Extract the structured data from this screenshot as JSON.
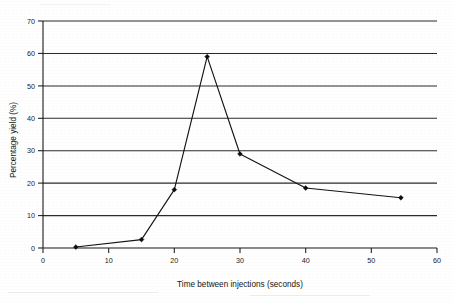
{
  "chart_data": {
    "type": "line",
    "title": "",
    "subtitle": "",
    "xlabel": "Time between injections (seconds)",
    "ylabel": "Percentage yield (%)",
    "xlim": [
      0,
      60
    ],
    "ylim": [
      0,
      70
    ],
    "xticks": [
      0,
      10,
      20,
      30,
      40,
      50,
      60
    ],
    "yticks": [
      0,
      10,
      20,
      30,
      40,
      50,
      60,
      70
    ],
    "xtick_labels": [
      "0",
      "10",
      "20",
      "30",
      "40",
      "50",
      "60"
    ],
    "ytick_labels": [
      "0",
      "10",
      "20",
      "30",
      "40",
      "50",
      "60",
      "70"
    ],
    "grid": "horizontal",
    "legend": "none",
    "marker": "filled-diamond",
    "line_color": "#151515",
    "marker_color": "#0d0d0d",
    "grid_color": "#2b2b2b",
    "background_color": "#ffffff",
    "x": [
      5,
      15,
      20,
      25,
      30,
      40,
      54.5
    ],
    "y": [
      0.3,
      2.6,
      18.0,
      59.0,
      29.0,
      18.5,
      15.5
    ],
    "series": [
      {
        "name": "Percentage yield",
        "points": [
          {
            "x": 5,
            "y": 0.3
          },
          {
            "x": 15,
            "y": 2.6
          },
          {
            "x": 20,
            "y": 18.0
          },
          {
            "x": 25,
            "y": 59.0
          },
          {
            "x": 30,
            "y": 29.0
          },
          {
            "x": 40,
            "y": 18.5
          },
          {
            "x": 54.5,
            "y": 15.5
          }
        ]
      }
    ],
    "annotations": []
  },
  "axes": {
    "x_title": "Time between injections (seconds)",
    "y_title": "Percentage yield (%)"
  }
}
